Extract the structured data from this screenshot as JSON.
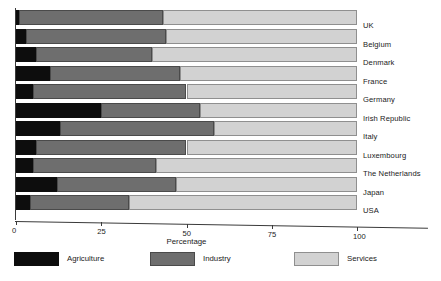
{
  "chart_data": {
    "type": "bar",
    "title": "",
    "subtitle": "",
    "orientation": "horizontal",
    "stacked": true,
    "stack_total": 100,
    "xlabel": "Percentage",
    "ylabel": "",
    "xlim": [
      0,
      100
    ],
    "xticks": [
      0,
      25,
      50,
      75,
      100
    ],
    "xtick_labels": [
      "0",
      "25",
      "50",
      "75",
      "100"
    ],
    "grid": false,
    "legend_position": "bottom",
    "categories": [
      "UK",
      "Belgium",
      "Denmark",
      "France",
      "Germany",
      "Irish Republic",
      "Italy",
      "Luxembourg",
      "The Netherlands",
      "Japan",
      "USA"
    ],
    "series": [
      {
        "name": "Agriculture",
        "color": "#0d0d0d",
        "values": [
          1,
          3,
          6,
          10,
          5,
          25,
          13,
          6,
          5,
          12,
          4
        ]
      },
      {
        "name": "Industry",
        "color": "#6e6e6e",
        "values": [
          42,
          41,
          34,
          38,
          45,
          29,
          45,
          44,
          36,
          35,
          29
        ]
      },
      {
        "name": "Services",
        "color": "#d2d2d2",
        "values": [
          57,
          56,
          60,
          52,
          50,
          46,
          42,
          50,
          59,
          53,
          67
        ]
      }
    ],
    "cumulative_boundaries": [
      {
        "category": "UK",
        "agriculture_end": 1,
        "industry_end": 43,
        "services_end": 100
      },
      {
        "category": "Belgium",
        "agriculture_end": 3,
        "industry_end": 44,
        "services_end": 100
      },
      {
        "category": "Denmark",
        "agriculture_end": 6,
        "industry_end": 40,
        "services_end": 100
      },
      {
        "category": "France",
        "agriculture_end": 10,
        "industry_end": 48,
        "services_end": 100
      },
      {
        "category": "Germany",
        "agriculture_end": 5,
        "industry_end": 50,
        "services_end": 100
      },
      {
        "category": "Irish Republic",
        "agriculture_end": 25,
        "industry_end": 54,
        "services_end": 100
      },
      {
        "category": "Italy",
        "agriculture_end": 13,
        "industry_end": 58,
        "services_end": 100
      },
      {
        "category": "Luxembourg",
        "agriculture_end": 6,
        "industry_end": 50,
        "services_end": 100
      },
      {
        "category": "The Netherlands",
        "agriculture_end": 5,
        "industry_end": 41,
        "services_end": 100
      },
      {
        "category": "Japan",
        "agriculture_end": 12,
        "industry_end": 47,
        "services_end": 100
      },
      {
        "category": "USA",
        "agriculture_end": 4,
        "industry_end": 33,
        "services_end": 100
      }
    ],
    "legend": [
      {
        "label": "Agriculture",
        "color": "#0d0d0d"
      },
      {
        "label": "Industry",
        "color": "#6e6e6e"
      },
      {
        "label": "Services",
        "color": "#d2d2d2"
      }
    ]
  }
}
